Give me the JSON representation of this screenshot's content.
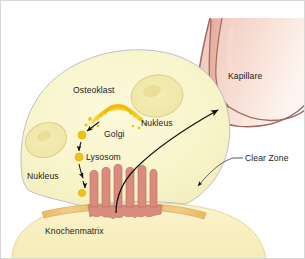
{
  "figure": {
    "width": 305,
    "height": 259,
    "background_color": "#ffffff"
  },
  "labels": {
    "osteoclast": "Osteoklast",
    "nucleus_right": "Nukleus",
    "nucleus_left": "Nukleus",
    "golgi": "Golgi",
    "lysosome": "Lysosom",
    "bone_matrix": "Knochenmatrix",
    "capillary": "Kapillare",
    "clear_zone": "Clear Zone"
  },
  "colors": {
    "cell_body_fill": "#f7f3c8",
    "cell_body_stroke": "#b9bcc4",
    "nucleus_fill": "#f2eab0",
    "nucleus_stroke": "#d8c98a",
    "nucleus_inner": "#ecdf95",
    "golgi_gold": "#f5c518",
    "golgi_gold_light": "#fad85a",
    "vesicle_gold": "#f3c211",
    "ruffled_border": "#d98b7d",
    "ruffled_border_stroke": "#c07566",
    "clear_zone_band": "#f0c070",
    "clear_zone_band_stroke": "#dba957",
    "bone_matrix_fill": "#f8eec0",
    "bone_matrix_stroke": "#e8dba0",
    "capillary_fill": "#f2cdc2",
    "capillary_fill_light": "#f7e0d8",
    "capillary_stroke": "#9c6a62",
    "capillary_lumen": "#eab4a3",
    "arrow_color": "#111111",
    "leader_color": "#555555",
    "text_color": "#1c1c1c",
    "frame_color": "#d8d8d8"
  },
  "elements": {
    "cell": {
      "name": "osteoclast-cell-body",
      "description": "Large rounded osteoclast cell"
    },
    "nuclei_count": 2,
    "vesicles_count": 3,
    "golgi_arcs": 4,
    "ruffled_border_projections": 8,
    "clear_zone_bands": 2,
    "arrows": [
      {
        "name": "golgi-to-vesicle-arrow",
        "from": "Golgi",
        "to": "Vesikel"
      },
      {
        "name": "vesicle-to-lysosome-arrow",
        "from": "Vesikel",
        "to": "Lysosom"
      },
      {
        "name": "lysosome-to-ruffled-border-arrow",
        "from": "Lysosom",
        "to": "Ruffled Border"
      },
      {
        "name": "resorption-to-capillary-arrow",
        "from": "Resorptionslakune",
        "to": "Kapillare"
      },
      {
        "name": "clear-zone-pointer-arrow",
        "from": "Clear Zone",
        "to": "Clear Zone Band"
      }
    ]
  }
}
